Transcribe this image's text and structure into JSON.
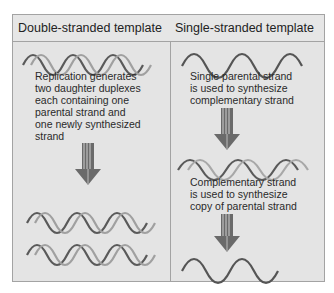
{
  "diagram": {
    "columns": [
      {
        "header": "Double-stranded template",
        "steps": [
          {
            "type": "double-helix",
            "label": "parental-duplex"
          },
          {
            "type": "text",
            "lines": [
              "Replication generates",
              "two daughter duplexes",
              "each containing one",
              "parental strand and",
              "one newly synthesized",
              "strand"
            ]
          },
          {
            "type": "arrow"
          },
          {
            "type": "double-helix",
            "label": "daughter-duplex-1"
          },
          {
            "type": "double-helix",
            "label": "daughter-duplex-2"
          }
        ]
      },
      {
        "header": "Single-stranded template",
        "steps": [
          {
            "type": "single-strand",
            "label": "parental-strand"
          },
          {
            "type": "text",
            "lines": [
              "Single parental strand",
              "is used to synthesize",
              "complementary strand"
            ]
          },
          {
            "type": "arrow"
          },
          {
            "type": "double-helix",
            "label": "intermediate-duplex"
          },
          {
            "type": "text",
            "lines": [
              "Complementary strand",
              "is used to synthesize",
              "copy of parental strand"
            ]
          },
          {
            "type": "arrow"
          },
          {
            "type": "single-strand",
            "label": "copy-strand"
          }
        ]
      }
    ],
    "colors": {
      "background": "#e4e4e4",
      "border": "#a3a3a3",
      "strand_dark": "#555555",
      "strand_light": "#9a9a9a",
      "text": "#2a2a2a"
    }
  }
}
